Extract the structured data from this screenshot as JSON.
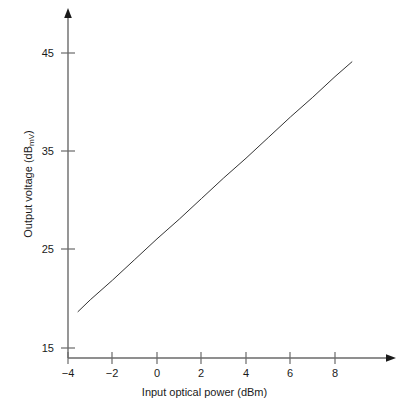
{
  "chart_data": {
    "type": "line",
    "title": "",
    "subtitle": "",
    "xlabel": "Input optical power (dBm)",
    "ylabel_text": "Output voltage (dB",
    "ylabel_sub": "mV",
    "ylabel_tail": ")",
    "ylabel": "Output voltage (dBmV)",
    "xlim": [
      -4.6,
      9.8
    ],
    "ylim": [
      15,
      47
    ],
    "xticks": [
      -4,
      -2,
      0,
      2,
      4,
      6,
      8
    ],
    "xtick_labels": [
      "−4",
      "−2",
      "0",
      "2",
      "4",
      "6",
      "8"
    ],
    "yticks": [
      15,
      25,
      35,
      45
    ],
    "ytick_labels": [
      "15",
      "25",
      "35",
      "45"
    ],
    "grid": false,
    "legend": null,
    "axis_style": "arrow-tipped L-axes",
    "line_color": "#333333",
    "line_width": 1,
    "series": [
      {
        "name": "Output voltage vs input optical power",
        "x": [
          -3.55,
          8.76
        ],
        "y": [
          18.7,
          44.1
        ],
        "points": [
          {
            "x": -3.55,
            "y": 18.7
          },
          {
            "x": -3.0,
            "y": 19.9
          },
          {
            "x": -2.0,
            "y": 21.9
          },
          {
            "x": -1.0,
            "y": 24.0
          },
          {
            "x": 0.0,
            "y": 26.1
          },
          {
            "x": 1.0,
            "y": 28.1
          },
          {
            "x": 2.0,
            "y": 30.2
          },
          {
            "x": 3.0,
            "y": 32.3
          },
          {
            "x": 4.0,
            "y": 34.3
          },
          {
            "x": 5.0,
            "y": 36.4
          },
          {
            "x": 6.0,
            "y": 38.5
          },
          {
            "x": 7.0,
            "y": 40.5
          },
          {
            "x": 8.0,
            "y": 42.6
          },
          {
            "x": 8.76,
            "y": 44.1
          }
        ],
        "slope_db_per_dbm": 2.06,
        "intercept_db": 26.1
      }
    ]
  },
  "colors": {
    "background": "#ffffff",
    "axis": "#555555",
    "text": "#1a1a1a",
    "line": "#333333"
  }
}
